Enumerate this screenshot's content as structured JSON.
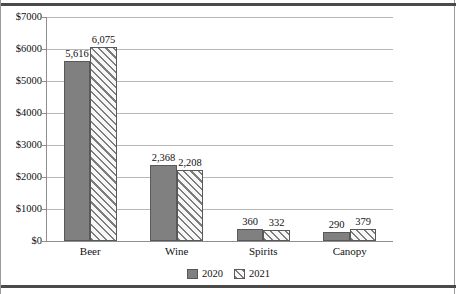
{
  "chart_data": {
    "type": "bar",
    "title": "",
    "subtitle": "",
    "xlabel": "",
    "ylabel": "",
    "categories": [
      "Beer",
      "Wine",
      "Spirits",
      "Canopy"
    ],
    "series": [
      {
        "name": "2020",
        "values": [
          5616,
          2368,
          360,
          290
        ],
        "labels": [
          "5,616",
          "2,368",
          "360",
          "290"
        ],
        "style": "solid",
        "color": "#808080"
      },
      {
        "name": "2021",
        "values": [
          6075,
          2208,
          332,
          379
        ],
        "labels": [
          "6,075",
          "2,208",
          "332",
          "379"
        ],
        "style": "diagonal-hatch",
        "color": "#7d7d7d"
      }
    ],
    "ylim": [
      0,
      7000
    ],
    "ytick_values": [
      0,
      1000,
      2000,
      3000,
      4000,
      5000,
      6000,
      7000
    ],
    "ytick_labels": [
      "$0",
      "$1000",
      "$2000",
      "$3000",
      "$4000",
      "$5000",
      "$6000",
      "$7000"
    ],
    "grid": true,
    "legend_position": "bottom",
    "legend_entries": [
      "2020",
      "2021"
    ],
    "data_labels_shown": true,
    "axis_color": "#8e8e8e",
    "grid_color": "#b7b7b7",
    "border_color": "#4a4a4a",
    "background": "#ffffff"
  }
}
